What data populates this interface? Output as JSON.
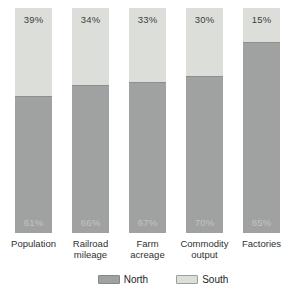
{
  "chart_data": {
    "type": "bar",
    "stacked": true,
    "orientation": "vertical",
    "categories": [
      "Population",
      "Railroad mileage",
      "Farm acreage",
      "Commodity output",
      "Factories"
    ],
    "series": [
      {
        "name": "North",
        "values": [
          61,
          66,
          67,
          70,
          85
        ],
        "color": "#a0a2a1",
        "label_position": "inside-bottom"
      },
      {
        "name": "South",
        "values": [
          39,
          34,
          33,
          30,
          15
        ],
        "color": "#dcded9",
        "label_position": "inside-top"
      }
    ],
    "value_label_format": "percent",
    "ylim": [
      0,
      100
    ],
    "grid": false,
    "axes_visible": false,
    "legend_position": "bottom",
    "title": ""
  },
  "legend": {
    "north_label": "North",
    "south_label": "South"
  },
  "colors": {
    "north_fill": "#a0a2a1",
    "south_fill": "#dcded9",
    "divider_line": "#8d8f8e",
    "south_label_text": "#3d3f3e",
    "north_label_text": "#c2c4c1",
    "category_text": "#2f3130",
    "background": "#ffffff"
  }
}
